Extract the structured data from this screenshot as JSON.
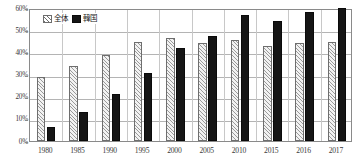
{
  "chart_data": {
    "type": "bar",
    "title": "",
    "xlabel": "",
    "ylabel": "",
    "ylim": [
      0,
      60
    ],
    "yticks": [
      "0%",
      "10%",
      "20%",
      "30%",
      "40%",
      "50%",
      "60%"
    ],
    "ytick_values": [
      0,
      10,
      20,
      30,
      40,
      50,
      60
    ],
    "grid": true,
    "legend_position": "top-left",
    "categories": [
      "1980",
      "1985",
      "1990",
      "1995",
      "2000",
      "2005",
      "2010",
      "2015",
      "2016",
      "2017"
    ],
    "series": [
      {
        "name": "全体",
        "style": "hatched",
        "color": "#f2f2f2",
        "values": [
          29,
          34,
          39,
          44.5,
          46.5,
          44,
          45.5,
          43,
          44,
          44.5
        ]
      },
      {
        "name": "韓国",
        "style": "solid",
        "color": "#151515",
        "values": [
          6.5,
          13,
          21,
          30.5,
          42,
          47.5,
          57,
          54,
          58,
          60
        ]
      }
    ]
  },
  "legend": {
    "items": [
      {
        "label": "全体",
        "swatch": "hatched-swatch"
      },
      {
        "label": "韓国",
        "swatch": "black-swatch"
      }
    ]
  }
}
